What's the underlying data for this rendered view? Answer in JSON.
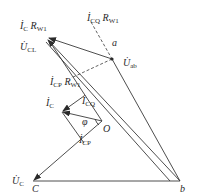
{
  "diagram": {
    "type": "phasor-diagram",
    "points": {
      "apex": {
        "x": 47,
        "y": 37
      },
      "a": {
        "x": 112,
        "y": 59,
        "label": "a"
      },
      "O": {
        "x": 102,
        "y": 121,
        "label": "O"
      },
      "b": {
        "x": 180,
        "y": 181,
        "label": "b"
      },
      "C": {
        "x": 33,
        "y": 181,
        "label": "C"
      },
      "Ic": {
        "x": 62,
        "y": 112
      },
      "Icp": {
        "x": 84,
        "y": 143
      }
    },
    "labels": {
      "ic_rw1": {
        "main": "İ",
        "sub1": "C",
        "mid": " R",
        "sub2": "W1"
      },
      "ucl": {
        "main": "U̇",
        "sub": "CL"
      },
      "icq_rw1": {
        "main": "İ",
        "sub1": "CQ",
        "mid": " R",
        "sub2": "W1"
      },
      "a": "a",
      "uab": {
        "main": "U̇",
        "sub": "ab"
      },
      "icp_rw1": {
        "main": "İ",
        "sub1": "CP",
        "mid": " R",
        "sub2": "W1"
      },
      "ic": {
        "main": "İ",
        "sub": "C"
      },
      "icq": {
        "main": "İ",
        "sub": "CQ"
      },
      "phi": "φ",
      "O": "O",
      "icp": {
        "main": "İ",
        "sub": "CP"
      },
      "uc": {
        "main": "U̇",
        "sub": "C"
      },
      "C": "C",
      "b": "b"
    },
    "colors": {
      "line": "#3a3a3a",
      "text": "#2a2a2a"
    }
  }
}
